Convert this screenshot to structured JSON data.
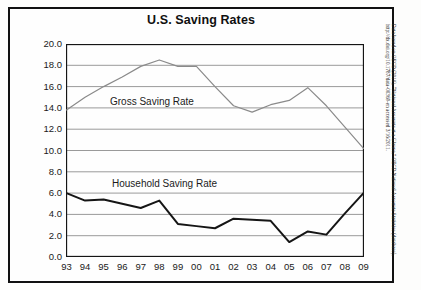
{
  "chart_data": {
    "type": "line",
    "title": "U.S. Saving Rates",
    "xlabel": "",
    "ylabel": "",
    "grid": true,
    "legend_position": "inline-annotation",
    "categories": [
      "93",
      "94",
      "95",
      "96",
      "97",
      "98",
      "99",
      "00",
      "01",
      "02",
      "03",
      "04",
      "05",
      "06",
      "07",
      "08",
      "09"
    ],
    "ylim": [
      0.0,
      20.0
    ],
    "ytick_step": 2.0,
    "yticks": [
      "20.0",
      "18.0",
      "16.0",
      "14.0",
      "12.0",
      "10.0",
      "8.0",
      "6.0",
      "4.0",
      "2.0",
      "0.0"
    ],
    "series": [
      {
        "name": "Gross Saving Rate",
        "color": "#8a8a8a",
        "width": 1.2,
        "values": [
          13.8,
          15.0,
          16.0,
          16.9,
          17.9,
          18.5,
          17.9,
          17.9,
          16.0,
          14.2,
          13.6,
          14.3,
          14.7,
          15.9,
          14.2,
          12.2,
          10.2
        ]
      },
      {
        "name": "Household Saving Rate",
        "color": "#151515",
        "width": 2.0,
        "values": [
          6.0,
          5.3,
          5.4,
          5.0,
          4.6,
          5.3,
          3.1,
          2.9,
          2.7,
          3.6,
          3.5,
          3.4,
          1.4,
          2.4,
          2.1,
          4.1,
          6.0
        ]
      }
    ],
    "annotations": [
      {
        "text": "Gross Saving Rate"
      },
      {
        "text": "Household Saving Rate"
      }
    ]
  },
  "source": {
    "note": "Data based on OECD (2010), “National Accounts at a Glance,” OECD National Accounts Statistics (database), http://dx.doi.org/10.1787/data-00369-en accessed 3/16/2011."
  },
  "colors": {
    "gross_line": "#8a8a8a",
    "household_line": "#151515",
    "gridline": "#9a9a9a",
    "frame": "#111111",
    "background": "#fefefe"
  }
}
